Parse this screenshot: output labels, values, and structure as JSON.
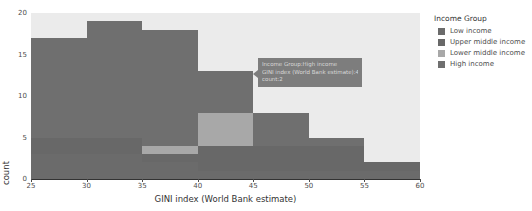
{
  "chart_data": {
    "type": "bar",
    "stacked": true,
    "title": "",
    "xlabel": "GINI index (World Bank estimate)",
    "ylabel": "count",
    "xlim": [
      25,
      60
    ],
    "ylim": [
      0,
      20
    ],
    "xticks": [
      25,
      30,
      35,
      40,
      45,
      50,
      55,
      60
    ],
    "yticks": [
      0,
      5,
      10,
      15,
      20
    ],
    "bin_width": 5,
    "grid": false,
    "legend_position": "right",
    "categories": [
      "25 - 29.9",
      "30 - 34.9",
      "35 - 39.9",
      "40 - 44.9",
      "45 - 49.9",
      "50 - 54.9",
      "55 - 59.9"
    ],
    "bin_edges": [
      25,
      30,
      35,
      40,
      45,
      50,
      55,
      60
    ],
    "series": [
      {
        "name": "Low income",
        "color": "#6b6b6b",
        "values": [
          3,
          3,
          2,
          1,
          1,
          1,
          1
        ]
      },
      {
        "name": "Upper middle income",
        "color": "#686868",
        "values": [
          2,
          2,
          1,
          3,
          3,
          3,
          1
        ]
      },
      {
        "name": "Lower middle income",
        "color": "#a8a8a8",
        "values": [
          0,
          0,
          1,
          4,
          0,
          0,
          0
        ]
      },
      {
        "name": "High income",
        "color": "#6f6f6f",
        "values": [
          12,
          14,
          14,
          5,
          4,
          1,
          0
        ]
      }
    ],
    "bin_totals": [
      17,
      19,
      18,
      13,
      8,
      5,
      2
    ]
  },
  "legend": {
    "title": "Income Group",
    "items": [
      {
        "label": "Low income",
        "color": "#6b6b6b"
      },
      {
        "label": "Upper middle income",
        "color": "#686868"
      },
      {
        "label": "Lower middle income",
        "color": "#a8a8a8"
      },
      {
        "label": "High income",
        "color": "#6f6f6f"
      }
    ]
  },
  "tooltip": {
    "line1": "Income Group:High income",
    "line2": "GINI index (World Bank estimate):40 - 44.9",
    "line3": "count:2"
  },
  "axes": {
    "x_title": "GINI index (World Bank estimate)",
    "y_title": "count",
    "x_tick_labels": [
      "25",
      "30",
      "35",
      "40",
      "45",
      "50",
      "55",
      "60"
    ],
    "y_tick_labels": [
      "0",
      "5",
      "10",
      "15",
      "20"
    ]
  },
  "colors": {
    "plot_background": "#ebebeb",
    "axis": "#333333",
    "tick_text": "#4d4d4d",
    "tooltip_bg": "#7d7d7d",
    "tooltip_text": "#d8d8d8"
  }
}
